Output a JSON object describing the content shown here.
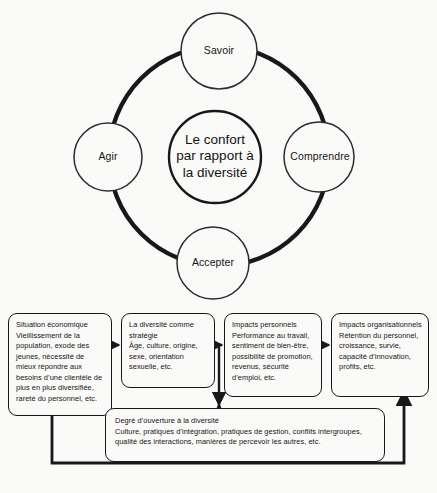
{
  "diagram": {
    "title_implicit": "Le confort par rapport à la diversité",
    "wheel": {
      "hub": {
        "line1": "Le confort",
        "line2": "par rapport à",
        "line3": "la diversité"
      },
      "spokes": [
        {
          "id": "savoir",
          "label": "Savoir",
          "position": "top"
        },
        {
          "id": "comprendre",
          "label": "Comprendre",
          "position": "right"
        },
        {
          "id": "accepter",
          "label": "Accepter",
          "position": "bottom"
        },
        {
          "id": "agir",
          "label": "Agir",
          "position": "left"
        }
      ]
    },
    "flow": {
      "boxes": [
        {
          "id": "situation-economique",
          "title": "Situation économique",
          "body": "Vieillissement de la population, exode des jeunes, nécessité de mieux répondre aux besoins d’une clientèle de plus en plus diversifiée, rareté du personnel, etc."
        },
        {
          "id": "diversite-strategie",
          "title": "La diversité comme stratégie",
          "body": "Âge, culture, origine, sexe, orientation sexuelle, etc."
        },
        {
          "id": "impacts-personnels",
          "title": "Impacts personnels",
          "body": "Performance au travail, sentiment de bien-être, possibilité de promotion, revenus, sécurité d’emploi, etc."
        },
        {
          "id": "impacts-organisationnels",
          "title": "Impacts organisationnels",
          "body": "Rétention du personnel, croissance, survie, capacité d’innovation, profits, etc."
        },
        {
          "id": "degre-ouverture",
          "title": "Degré d’ouverture à la diversité",
          "body": "Culture, pratiques d’intégration, pratiques de gestion, conflits intergroupes, qualité des interactions, manières de percevoir les autres, etc."
        }
      ],
      "connectors": [
        {
          "id": "arrow-box1-box2",
          "type": "arrow-right"
        },
        {
          "id": "arrow-box2-box3",
          "type": "arrow-right"
        },
        {
          "id": "arrow-box3-box4",
          "type": "arrow-right"
        },
        {
          "id": "arrow-to-degre-ouverture",
          "type": "arrow-down"
        },
        {
          "id": "feedback-loop-return",
          "type": "arrow-up"
        },
        {
          "id": "feedback-loop-down",
          "type": "arrow-down"
        }
      ]
    },
    "colors": {
      "stroke": "#16181a",
      "background": "#fafaf9",
      "text": "#141414"
    }
  }
}
